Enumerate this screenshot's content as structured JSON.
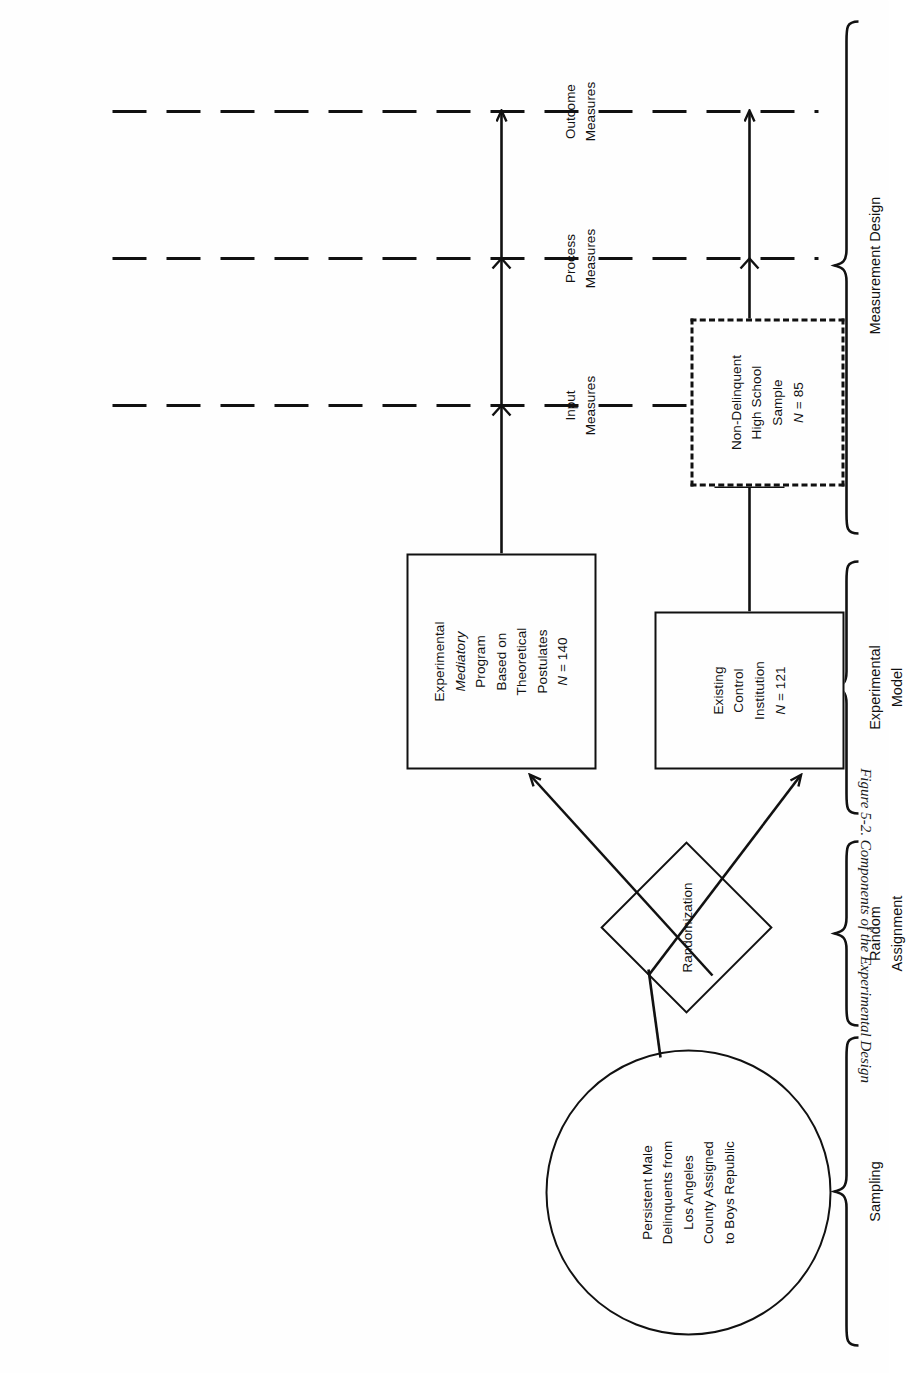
{
  "figure": {
    "caption": "Figure 5-2.  Components of the Experimental Design",
    "orientation": "rotated-90-ccw"
  },
  "nodes": {
    "sample_circle": {
      "shape": "ellipse",
      "lines": [
        "Persistent Male",
        "Delinquents from",
        "Los Angeles",
        "County Assigned",
        "to Boys Republic"
      ]
    },
    "randomization": {
      "shape": "diamond",
      "label": "Randomization"
    },
    "experimental_box": {
      "shape": "rect",
      "lines": [
        "Experimental",
        "Mediatory",
        "Program",
        "Based on",
        "Theoretical",
        "Postulates"
      ],
      "italic_line_index": 1,
      "n_label": "N = 140",
      "n_symbol": "N",
      "n_value": "140"
    },
    "control_box": {
      "shape": "rect",
      "lines": [
        "Existing",
        "Control",
        "Institution"
      ],
      "n_label": "N = 121",
      "n_symbol": "N",
      "n_value": "121"
    },
    "nondelinquent_box": {
      "shape": "rect-dashed",
      "lines": [
        "Non-Delinquent",
        "High School",
        "Sample"
      ],
      "n_label": "N = 85",
      "n_symbol": "N",
      "n_value": "85"
    }
  },
  "measure_columns": [
    {
      "id": "input",
      "lines": [
        "Input",
        "Measures"
      ]
    },
    {
      "id": "process",
      "lines": [
        "Process",
        "Measures"
      ]
    },
    {
      "id": "outcome",
      "lines": [
        "Outcome",
        "Measures"
      ]
    }
  ],
  "brackets": [
    {
      "id": "sampling",
      "lines": [
        "Sampling"
      ]
    },
    {
      "id": "random-assignment",
      "lines": [
        "Random",
        "Assignment"
      ]
    },
    {
      "id": "experimental-model",
      "lines": [
        "Experimental",
        "Model"
      ]
    },
    {
      "id": "measurement-design",
      "lines": [
        "Measurement Design"
      ]
    }
  ],
  "style": {
    "ink": "#111111",
    "paper": "#fefefe"
  }
}
